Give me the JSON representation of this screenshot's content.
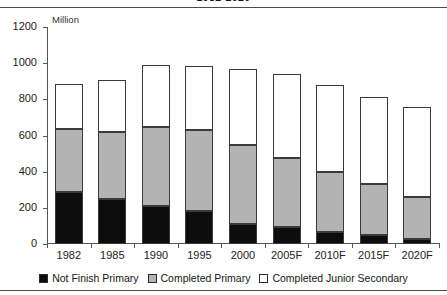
{
  "title": "1982-2020",
  "unit_label": "Million",
  "chart_data": {
    "type": "bar",
    "stacked": true,
    "title": "1982-2020",
    "xlabel": "",
    "ylabel": "Million",
    "ylim": [
      0,
      1200
    ],
    "ytick_values": [
      0,
      200,
      400,
      600,
      800,
      1000,
      1200
    ],
    "ytick_labels": [
      "0",
      "200",
      "400",
      "600",
      "800",
      "1000",
      "1200"
    ],
    "grid": false,
    "legend_position": "bottom",
    "categories": [
      "1982",
      "1985",
      "1990",
      "1995",
      "2000",
      "2005F",
      "2010F",
      "2015F",
      "2020F"
    ],
    "series": [
      {
        "name": "Not Finish Primary",
        "color": "#0d0d0d",
        "values": [
          285,
          250,
          210,
          180,
          110,
          95,
          65,
          50,
          30
        ]
      },
      {
        "name": "Completed Primary",
        "color": "#b3b3b3",
        "values": [
          350,
          370,
          435,
          450,
          440,
          380,
          335,
          280,
          230
        ]
      },
      {
        "name": "Completed Junior Secondary",
        "color": "#ffffff",
        "values": [
          250,
          285,
          345,
          355,
          420,
          465,
          480,
          485,
          500
        ]
      }
    ],
    "totals": [
      885,
      905,
      990,
      985,
      970,
      940,
      880,
      815,
      760
    ]
  },
  "legend": [
    {
      "label": "Not Finish Primary",
      "swatch": "black-swatch"
    },
    {
      "label": "Completed Primary",
      "swatch": "gray-swatch"
    },
    {
      "label": "Completed Junior Secondary",
      "swatch": "white-swatch"
    }
  ]
}
